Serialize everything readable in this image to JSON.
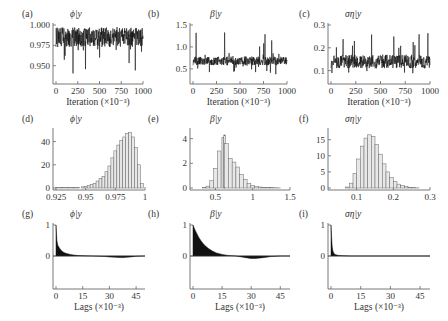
{
  "chart_data": [
    {
      "id": "a",
      "type": "line",
      "panel_label": "(a)",
      "title": "ϕ|y",
      "xlabel": "Iteration (×10⁻³)",
      "xlim": [
        0,
        1000
      ],
      "ylim": [
        0.93,
        1.0
      ],
      "xticks": [
        "0",
        "250",
        "500",
        "750",
        "1000"
      ],
      "xtick_values": [
        0,
        250,
        500,
        750,
        1000
      ],
      "yticks": [
        "0.950",
        "0.975",
        "1.000"
      ],
      "ytick_values": [
        0.95,
        0.975,
        1.0
      ],
      "trace": {
        "mean": 0.985,
        "spread": 0.012,
        "min": 0.94,
        "max": 0.999
      }
    },
    {
      "id": "b",
      "type": "line",
      "panel_label": "(b)",
      "title": "β|y",
      "xlabel": "Iteration (×10⁻³)",
      "xlim": [
        0,
        1000
      ],
      "ylim": [
        0.2,
        1.5
      ],
      "xticks": [
        "0",
        "250",
        "500",
        "750",
        "1000"
      ],
      "xtick_values": [
        0,
        250,
        500,
        750,
        1000
      ],
      "yticks": [
        "0.5",
        "1.0",
        "1.5"
      ],
      "ytick_values": [
        0.5,
        1.0,
        1.5
      ],
      "trace": {
        "mean": 0.68,
        "spread": 0.1,
        "min": 0.35,
        "max": 1.35
      }
    },
    {
      "id": "c",
      "type": "line",
      "panel_label": "(c)",
      "title": "ση|y",
      "xlabel": "Iteration (×10⁻³)",
      "xlim": [
        0,
        1000
      ],
      "ylim": [
        0.05,
        0.3
      ],
      "xticks": [
        "0",
        "250",
        "500",
        "750",
        "1000"
      ],
      "xtick_values": [
        0,
        250,
        500,
        750,
        1000
      ],
      "yticks": [
        "0.1",
        "0.2",
        "0.3"
      ],
      "ytick_values": [
        0.1,
        0.2,
        0.3
      ],
      "trace": {
        "mean": 0.14,
        "spread": 0.03,
        "min": 0.08,
        "max": 0.27
      }
    },
    {
      "id": "d",
      "type": "bar",
      "panel_label": "(d)",
      "title": "ϕ|y",
      "xlim": [
        0.925,
        1.0
      ],
      "ylim": [
        0,
        50
      ],
      "xticks": [
        "0.925",
        "0.95",
        "0.975",
        "1"
      ],
      "xtick_values": [
        0.925,
        0.95,
        0.975,
        1.0
      ],
      "yticks": [
        "0",
        "20",
        "40"
      ],
      "ytick_values": [
        0,
        20,
        40
      ],
      "x": [
        0.9275,
        0.9325,
        0.9375,
        0.9425,
        0.9475,
        0.95,
        0.9525,
        0.955,
        0.9575,
        0.96,
        0.9625,
        0.965,
        0.9675,
        0.97,
        0.9725,
        0.975,
        0.9775,
        0.98,
        0.9825,
        0.985,
        0.9875,
        0.99,
        0.9925,
        0.995,
        0.9975
      ],
      "values": [
        0.3,
        0.3,
        0.4,
        0.5,
        1,
        1.5,
        2,
        3,
        4,
        6,
        8,
        10,
        14,
        19,
        26,
        32,
        37,
        41,
        44,
        47,
        48,
        44,
        35,
        20,
        4
      ]
    },
    {
      "id": "e",
      "type": "bar",
      "panel_label": "(e)",
      "title": "β|y",
      "xlim": [
        0.2,
        1.5
      ],
      "ylim": [
        0,
        4.7
      ],
      "xticks": [
        "0.5",
        "1",
        "1.5"
      ],
      "xtick_values": [
        0.5,
        1.0,
        1.5
      ],
      "yticks": [
        "0",
        "2",
        "4"
      ],
      "ytick_values": [
        0,
        2,
        4
      ],
      "x": [
        0.35,
        0.4,
        0.45,
        0.5,
        0.55,
        0.6,
        0.625,
        0.65,
        0.7,
        0.75,
        0.8,
        0.85,
        0.9,
        0.95,
        1.0,
        1.05,
        1.1,
        1.15,
        1.2,
        1.25,
        1.3,
        1.35
      ],
      "values": [
        0.05,
        0.15,
        0.6,
        1.6,
        3.0,
        4.1,
        4.3,
        3.6,
        2.4,
        2.1,
        1.7,
        1.1,
        0.7,
        0.35,
        0.2,
        0.12,
        0.08,
        0.05,
        0.04,
        0.03,
        0.02,
        0.01
      ]
    },
    {
      "id": "f",
      "type": "bar",
      "panel_label": "(f)",
      "title": "ση|y",
      "xlim": [
        0.03,
        0.3
      ],
      "ylim": [
        0,
        18
      ],
      "xticks": [
        "0.1",
        "0.2",
        "0.3"
      ],
      "xtick_values": [
        0.1,
        0.2,
        0.3
      ],
      "yticks": [
        "0",
        "5",
        "10",
        "15"
      ],
      "ytick_values": [
        0,
        5,
        10,
        15
      ],
      "x": [
        0.075,
        0.085,
        0.095,
        0.105,
        0.115,
        0.125,
        0.135,
        0.145,
        0.155,
        0.165,
        0.175,
        0.185,
        0.195,
        0.205,
        0.215,
        0.225,
        0.235,
        0.245,
        0.255,
        0.265
      ],
      "values": [
        0.3,
        1.5,
        4.5,
        9,
        13,
        15.5,
        16.5,
        16,
        13.5,
        10.5,
        7.5,
        5,
        3.2,
        2,
        1.2,
        0.7,
        0.4,
        0.2,
        0.1,
        0.05
      ]
    },
    {
      "id": "g",
      "type": "area",
      "panel_label": "(g)",
      "title": "ϕ|y",
      "xlabel": "Lags (×10⁻³)",
      "xlim": [
        0,
        50
      ],
      "ylim": [
        -1,
        1
      ],
      "xticks": [
        "0",
        "15",
        "30",
        "45"
      ],
      "xtick_values": [
        0,
        15,
        30,
        45
      ],
      "yticks": [
        "0",
        "1"
      ],
      "ytick_values": [
        0,
        1
      ],
      "x": [
        0,
        0.5,
        1,
        2,
        3,
        4,
        5,
        6,
        8,
        10,
        12,
        15,
        20,
        25,
        28,
        30,
        33,
        36,
        38,
        40,
        42,
        45,
        50
      ],
      "values": [
        1,
        0.5,
        0.35,
        0.25,
        0.18,
        0.13,
        0.1,
        0.08,
        0.05,
        0.03,
        0.02,
        0.01,
        0,
        -0.01,
        -0.02,
        -0.03,
        -0.04,
        -0.05,
        -0.05,
        -0.04,
        -0.03,
        -0.01,
        0
      ]
    },
    {
      "id": "h",
      "type": "area",
      "panel_label": "(h)",
      "title": "β|y",
      "xlabel": "Lags (×10⁻³)",
      "xlim": [
        0,
        50
      ],
      "ylim": [
        -1,
        1
      ],
      "xticks": [
        "0",
        "15",
        "30",
        "45"
      ],
      "xtick_values": [
        0,
        15,
        30,
        45
      ],
      "yticks": [
        "0",
        "1"
      ],
      "ytick_values": [
        0,
        1
      ],
      "x": [
        0,
        1,
        2,
        3,
        4,
        5,
        6,
        8,
        10,
        12,
        15,
        18,
        20,
        22,
        25,
        28,
        30,
        32,
        35,
        38,
        40,
        45,
        50
      ],
      "values": [
        1,
        0.85,
        0.72,
        0.6,
        0.5,
        0.42,
        0.35,
        0.24,
        0.16,
        0.1,
        0.05,
        0.02,
        0.01,
        0,
        -0.03,
        -0.06,
        -0.08,
        -0.08,
        -0.06,
        -0.04,
        -0.02,
        0,
        0
      ]
    },
    {
      "id": "i",
      "type": "area",
      "panel_label": "(i)",
      "title": "ση|y",
      "xlabel": "Lags (×10⁻³)",
      "xlim": [
        0,
        50
      ],
      "ylim": [
        -1,
        1
      ],
      "xticks": [
        "0",
        "15",
        "30",
        "45"
      ],
      "xtick_values": [
        0,
        15,
        30,
        45
      ],
      "yticks": [
        "0",
        "1"
      ],
      "ytick_values": [
        0,
        1
      ],
      "x": [
        0,
        0.3,
        0.6,
        1,
        1.5,
        2,
        3,
        4,
        6,
        10,
        20,
        30,
        40,
        50
      ],
      "values": [
        1,
        0.6,
        0.3,
        0.15,
        0.08,
        0.05,
        0.03,
        0.02,
        0.01,
        0,
        0,
        0,
        0,
        0
      ]
    }
  ]
}
